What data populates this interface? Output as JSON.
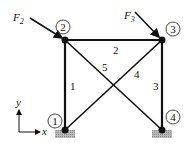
{
  "diagram": {
    "type": "truss",
    "nodes": [
      {
        "id": "1",
        "label": "1",
        "x": 65,
        "y": 130,
        "support": true
      },
      {
        "id": "2",
        "label": "2",
        "x": 65,
        "y": 40,
        "support": false
      },
      {
        "id": "3",
        "label": "3",
        "x": 162,
        "y": 40,
        "support": false
      },
      {
        "id": "4",
        "label": "4",
        "x": 162,
        "y": 130,
        "support": true
      }
    ],
    "members": [
      {
        "id": "1",
        "label": "1",
        "from": "1",
        "to": "2"
      },
      {
        "id": "2",
        "label": "2",
        "from": "2",
        "to": "3"
      },
      {
        "id": "3",
        "label": "3",
        "from": "3",
        "to": "4"
      },
      {
        "id": "4",
        "label": "4",
        "from": "1",
        "to": "3"
      },
      {
        "id": "5",
        "label": "5",
        "from": "2",
        "to": "4"
      }
    ],
    "loads": [
      {
        "name": "F",
        "sub": "2",
        "at_node": "2"
      },
      {
        "name": "F",
        "sub": "3",
        "at_node": "3"
      }
    ],
    "axes": {
      "x_label": "x",
      "y_label": "y"
    }
  }
}
